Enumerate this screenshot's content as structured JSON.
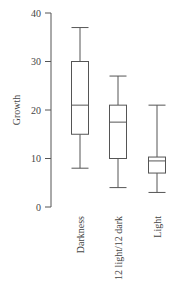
{
  "chart_data": {
    "type": "box",
    "title": "",
    "xlabel": "",
    "ylabel": "Growth",
    "ylim": [
      0,
      40
    ],
    "yticks": [
      0,
      10,
      20,
      30,
      40
    ],
    "grid": false,
    "legend": null,
    "categories": [
      "Darkness",
      "12 light/12 dark",
      "Light"
    ],
    "boxes": [
      {
        "name": "Darkness",
        "whisker_low": 8,
        "q1": 15,
        "median": 21,
        "q3": 30,
        "whisker_high": 37
      },
      {
        "name": "12 light/12 dark",
        "whisker_low": 4,
        "q1": 10,
        "median": 17.5,
        "q3": 21,
        "whisker_high": 27
      },
      {
        "name": "Light",
        "whisker_low": 3,
        "q1": 7,
        "median": 9.5,
        "q3": 10.3,
        "whisker_high": 21
      }
    ]
  },
  "colors": {
    "line": "#555555",
    "text": "#444444"
  }
}
